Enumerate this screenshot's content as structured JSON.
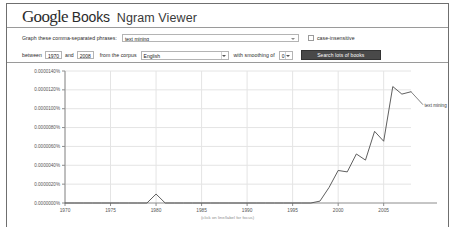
{
  "header": {
    "logo_google": "Google",
    "logo_books": "Books",
    "app_title": "Ngram Viewer"
  },
  "controls": {
    "phrases_label": "Graph these comma-separated phrases:",
    "phrases_value": "text mining",
    "case_insensitive_label": "case-insensitive",
    "case_insensitive_checked": false,
    "between_label": "between",
    "year_start": "1970",
    "and_label": "and",
    "year_end": "2008",
    "corpus_label": "from the corpus",
    "corpus_value": "English",
    "smoothing_label": "with smoothing of",
    "smoothing_value": "0",
    "search_button": "Search lots of books"
  },
  "chart_caption": "(click on line/label for focus)",
  "colors": {
    "series_line": "#4d4d4d",
    "grid": "#e4e4e4",
    "axis": "#8c8c8c",
    "button_bg": "#494949",
    "text": "#2a2a2a"
  },
  "chart_data": {
    "type": "line",
    "title": "",
    "xlabel": "",
    "ylabel": "",
    "xlim": [
      1970,
      2008
    ],
    "ylim": [
      0.0,
      1.4e-05
    ],
    "grid": true,
    "legend_position": "right-label",
    "annotation": "(click on line/label for focus)",
    "xticks": [
      "1970",
      "1975",
      "1980",
      "1985",
      "1990",
      "1995",
      "2000",
      "2005"
    ],
    "xtick_values": [
      1970,
      1975,
      1980,
      1985,
      1990,
      1995,
      2000,
      2005
    ],
    "yticks": [
      "0.0000140%",
      "0.0000120%",
      "0.0000100%",
      "0.0000080%",
      "0.0000060%",
      "0.0000040%",
      "0.0000020%",
      "0.0000000%"
    ],
    "ytick_values": [
      1.4e-05,
      1.2e-05,
      1e-05,
      8e-06,
      6e-06,
      4e-06,
      2e-06,
      0.0
    ],
    "series": [
      {
        "name": "text mining",
        "color": "#4d4d4d",
        "x": [
          1970,
          1971,
          1972,
          1973,
          1974,
          1975,
          1976,
          1977,
          1978,
          1979,
          1980,
          1981,
          1982,
          1983,
          1984,
          1985,
          1986,
          1987,
          1988,
          1989,
          1990,
          1991,
          1992,
          1993,
          1994,
          1995,
          1996,
          1997,
          1998,
          1999,
          2000,
          2001,
          2002,
          2003,
          2004,
          2005,
          2006,
          2007,
          2008
        ],
        "y": [
          0.0,
          0.0,
          0.0,
          0.0,
          0.0,
          0.0,
          0.0,
          0.0,
          0.0,
          0.0,
          9.5e-07,
          0.0,
          0.0,
          0.0,
          0.0,
          0.0,
          0.0,
          0.0,
          0.0,
          0.0,
          0.0,
          0.0,
          0.0,
          0.0,
          0.0,
          0.0,
          0.0,
          0.0,
          2e-07,
          1.65e-06,
          3.45e-06,
          3.3e-06,
          5.2e-06,
          4.55e-06,
          7.6e-06,
          6.55e-06,
          1.235e-05,
          1.155e-05,
          1.18e-05
        ]
      }
    ]
  }
}
